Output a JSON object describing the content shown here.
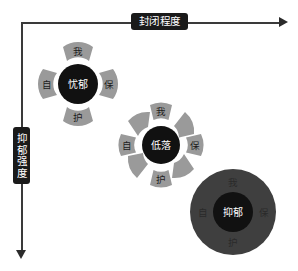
{
  "diagram": {
    "title_axis_x": "封闭程度",
    "title_axis_y": "抑郁强度",
    "colors": {
      "core": "#111111",
      "petal": "#9a9a9a",
      "petal_dark": "#3f3f3f",
      "axis": "#3a3a3a",
      "plaque_bg": "#1a1a1a",
      "plaque_text": "#ffffff",
      "background": "#ffffff"
    },
    "clusters": [
      {
        "id": "cluster-melancholy",
        "core_label": "忧郁",
        "petal_count": 4,
        "petals": [
          {
            "label": "我",
            "position": "top"
          },
          {
            "label": "保",
            "position": "right"
          },
          {
            "label": "护",
            "position": "bottom"
          },
          {
            "label": "自",
            "position": "left"
          }
        ]
      },
      {
        "id": "cluster-low-mood",
        "core_label": "低落",
        "petal_count": 8,
        "petals": [
          {
            "label": "我",
            "position": "top"
          },
          {
            "label": "",
            "position": "top-right"
          },
          {
            "label": "保",
            "position": "right"
          },
          {
            "label": "",
            "position": "bottom-right"
          },
          {
            "label": "护",
            "position": "bottom"
          },
          {
            "label": "",
            "position": "bottom-left"
          },
          {
            "label": "自",
            "position": "left"
          },
          {
            "label": "",
            "position": "top-left"
          }
        ]
      },
      {
        "id": "cluster-depression",
        "core_label": "抑郁",
        "petal_count": 0,
        "petals": [
          {
            "label": "我",
            "position": "top"
          },
          {
            "label": "保",
            "position": "right"
          },
          {
            "label": "护",
            "position": "bottom"
          },
          {
            "label": "自",
            "position": "left"
          }
        ]
      }
    ]
  }
}
